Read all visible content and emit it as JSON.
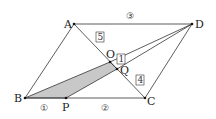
{
  "diagram": {
    "type": "geometry",
    "shape": "parallelogram ABCD",
    "points": {
      "A": {
        "label": "A",
        "x": 74,
        "y": 24
      },
      "B": {
        "label": "B",
        "x": 25,
        "y": 98
      },
      "C": {
        "label": "C",
        "x": 145,
        "y": 98
      },
      "D": {
        "label": "D",
        "x": 192,
        "y": 24
      },
      "P": {
        "label": "P",
        "x": 66,
        "y": 98
      },
      "O": {
        "label": "O",
        "x": 110,
        "y": 62
      },
      "Q": {
        "label": "Q",
        "x": 117,
        "y": 69
      }
    },
    "ratio_labels": {
      "AD": "③",
      "BP": "①",
      "PC": "②"
    },
    "box_labels": {
      "AO": "5",
      "OQ": "1",
      "QC": "4"
    },
    "shaded_region": "B-O-Q-P",
    "colors": {
      "line": "#333333",
      "shade": "#c8c8c8",
      "point": "#111111"
    }
  }
}
